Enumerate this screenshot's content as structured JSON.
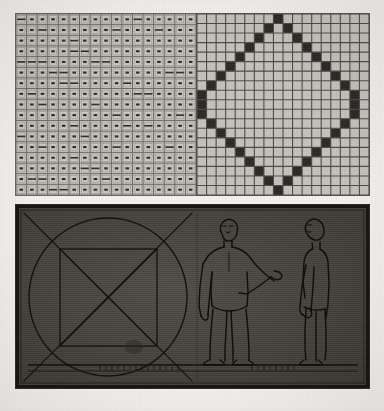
{
  "plate": {
    "title": "Engraved plate: proportional grids and human figure canon",
    "background_color": "#f4f2ee",
    "width": 384,
    "height": 411
  },
  "panels": [
    {
      "id": "fine-grid",
      "name": "fine dotted proportional grid",
      "columns": 17,
      "rows": 17,
      "cell_mark": "dash",
      "fill_color": "#cfccc6",
      "line_color": "#6b6862",
      "mark_color": "#2b2926"
    },
    {
      "id": "diamond-grid",
      "name": "grid with inscribed diamond of filled cells",
      "columns": 18,
      "rows": 19,
      "fill_color": "#c9c6c0",
      "line_color": "#4f4c47",
      "filled_cell_color": "#2b2926",
      "shape": "diamond"
    },
    {
      "id": "scene",
      "name": "dark hatched panel with geometry and two figures",
      "fill_color": "#4a4741",
      "ink_color": "#17150f",
      "elements": [
        "circle",
        "inscribed-square",
        "large-diagonal-cross",
        "inner-diagonal-cross",
        "figure-frontal",
        "figure-profile",
        "ground-line"
      ]
    }
  ],
  "chart_data": {
    "type": "heatmap",
    "xlabel": "",
    "ylabel": "",
    "grid": true,
    "legend": "none",
    "categories": [
      "col1",
      "col2",
      "col3",
      "col4",
      "col5",
      "col6",
      "col7",
      "col8",
      "col9",
      "col10",
      "col11",
      "col12",
      "col13",
      "col14",
      "col15",
      "col16",
      "col17",
      "col18"
    ],
    "diamond_cells": [
      [
        9,
        0
      ],
      [
        8,
        1
      ],
      [
        10,
        1
      ],
      [
        7,
        2
      ],
      [
        11,
        2
      ],
      [
        6,
        3
      ],
      [
        12,
        3
      ],
      [
        5,
        4
      ],
      [
        13,
        4
      ],
      [
        4,
        5
      ],
      [
        14,
        5
      ],
      [
        3,
        6
      ],
      [
        15,
        6
      ],
      [
        2,
        7
      ],
      [
        16,
        7
      ],
      [
        1,
        8
      ],
      [
        17,
        8
      ],
      [
        1,
        9
      ],
      [
        17,
        9
      ],
      [
        1,
        10
      ],
      [
        17,
        10
      ],
      [
        2,
        11
      ],
      [
        16,
        11
      ],
      [
        3,
        12
      ],
      [
        15,
        12
      ],
      [
        4,
        13
      ],
      [
        14,
        13
      ],
      [
        5,
        14
      ],
      [
        13,
        14
      ],
      [
        6,
        15
      ],
      [
        12,
        15
      ],
      [
        7,
        16
      ],
      [
        11,
        16
      ],
      [
        8,
        17
      ],
      [
        10,
        17
      ],
      [
        9,
        18
      ]
    ],
    "rows": 19,
    "cols": 18
  },
  "figures": {
    "frontal": {
      "label": "frontal standing figure",
      "pose": "arm raised to side"
    },
    "profile": {
      "label": "profile standing figure",
      "pose": "arms at side"
    }
  }
}
